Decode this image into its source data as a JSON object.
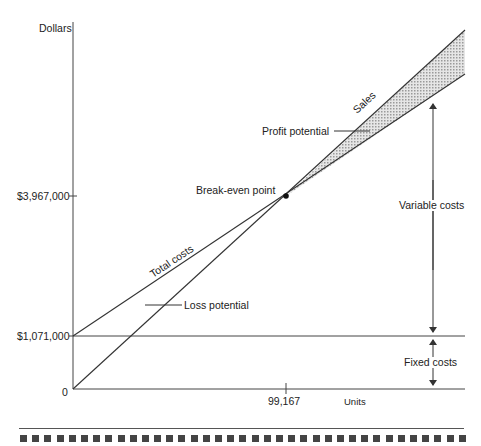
{
  "chart_data": {
    "type": "line",
    "xlabel": "Units",
    "ylabel": "Dollars",
    "x_ticks": [
      "99,167"
    ],
    "y_ticks": [
      "0",
      "$1,071,000",
      "$3,967,000"
    ],
    "break_even": {
      "units": 99167,
      "dollars": 3967000,
      "label": "Break-even point"
    },
    "series": [
      {
        "name": "Sales",
        "points": [
          [
            0,
            0
          ],
          [
            99167,
            3967000
          ],
          [
            181000,
            7240000
          ]
        ]
      },
      {
        "name": "Total costs",
        "points": [
          [
            0,
            1071000
          ],
          [
            99167,
            3967000
          ],
          [
            181000,
            6360000
          ]
        ]
      },
      {
        "name": "Fixed costs",
        "points": [
          [
            0,
            1071000
          ],
          [
            181000,
            1071000
          ]
        ]
      }
    ],
    "annotations": [
      "Profit potential",
      "Loss potential",
      "Variable costs",
      "Fixed costs",
      "Sales",
      "Total costs",
      "Break-even point"
    ],
    "grid": false,
    "legend": "none"
  },
  "labels": {
    "y_axis": "Dollars",
    "x_axis": "Units",
    "y_tick_high": "$3,967,000",
    "y_tick_fixed": "$1,071,000",
    "y_tick_zero": "0",
    "x_tick": "99,167",
    "break_even": "Break-even point",
    "profit_potential": "Profit potential",
    "loss_potential": "Loss potential",
    "variable_costs": "Variable costs",
    "fixed_costs": "Fixed costs",
    "sales": "Sales",
    "total_costs": "Total costs"
  },
  "colors": {
    "line": "#333333",
    "shade": "#c8c8c8",
    "separator": "#555555",
    "squares": "#444444"
  },
  "footer": {
    "square_count": 37
  }
}
